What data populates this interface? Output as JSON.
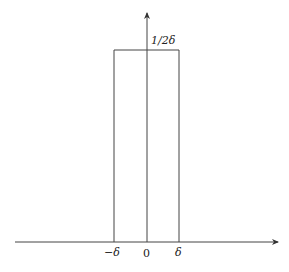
{
  "diagram": {
    "type": "rectangular pulse function plot",
    "height_label": "1/2δ",
    "x_tick_labels": [
      "−δ",
      "0",
      "δ"
    ],
    "colors": {
      "line": "#333333",
      "background": "#ffffff"
    }
  }
}
